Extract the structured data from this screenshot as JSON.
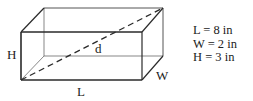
{
  "diagram": {
    "type": "rectangular-prism",
    "labels": {
      "height": "H",
      "length": "L",
      "width": "W",
      "diagonal": "d"
    },
    "legend": [
      {
        "text": "L = 8 in"
      },
      {
        "text": "W = 2 in"
      },
      {
        "text": "H = 3 in"
      }
    ],
    "colors": {
      "line": "#2a2a2a",
      "hidden_line": "#555555",
      "text": "#222222",
      "background": "#ffffff"
    }
  }
}
